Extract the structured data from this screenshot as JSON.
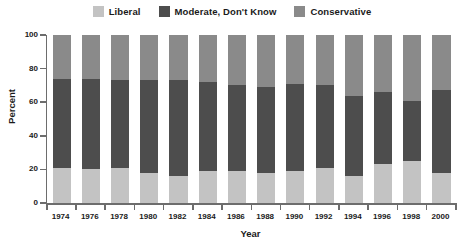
{
  "chart_data": {
    "type": "bar",
    "subtype": "stacked-bar-100",
    "title": "",
    "xlabel": "Year",
    "ylabel": "Percent",
    "ylim": [
      0,
      100
    ],
    "yticks": [
      0,
      20,
      40,
      60,
      80,
      100
    ],
    "grid": false,
    "legend_position": "top-center",
    "categories": [
      "1974",
      "1976",
      "1978",
      "1980",
      "1982",
      "1984",
      "1986",
      "1988",
      "1990",
      "1992",
      "1994",
      "1996",
      "1998",
      "2000"
    ],
    "series": [
      {
        "name": "Liberal",
        "color": "#c3c3c3",
        "values": [
          21,
          20,
          21,
          18,
          16,
          19,
          19,
          18,
          19,
          21,
          16,
          23,
          25,
          18
        ]
      },
      {
        "name": "Moderate, Don't Know",
        "color": "#4d4d4d",
        "values": [
          53,
          54,
          52,
          55,
          57,
          53,
          51,
          51,
          52,
          49,
          48,
          43,
          36,
          49
        ]
      },
      {
        "name": "Conservative",
        "color": "#8a8a8a",
        "values": [
          26,
          26,
          27,
          27,
          27,
          28,
          30,
          31,
          29,
          30,
          36,
          34,
          39,
          33
        ]
      }
    ],
    "cumulative_tops": {
      "liberal": [
        21,
        20,
        21,
        18,
        16,
        19,
        19,
        18,
        19,
        21,
        16,
        23,
        25,
        18
      ],
      "moderate": [
        74,
        74,
        73,
        73,
        73,
        72,
        70,
        69,
        71,
        70,
        64,
        66,
        61,
        67
      ]
    }
  },
  "legend": {
    "items": [
      {
        "label": "Liberal",
        "color": "#c3c3c3",
        "swatch_name": "legend-swatch-liberal"
      },
      {
        "label": "Moderate, Don't Know",
        "color": "#4d4d4d",
        "swatch_name": "legend-swatch-moderate"
      },
      {
        "label": "Conservative",
        "color": "#8a8a8a",
        "swatch_name": "legend-swatch-conservative"
      }
    ]
  },
  "axes": {
    "y_title": "Percent",
    "x_title": "Year",
    "y_tick_labels": [
      "100",
      "80",
      "60",
      "40",
      "20",
      "0"
    ],
    "axis_color": "#6d6d6d"
  }
}
